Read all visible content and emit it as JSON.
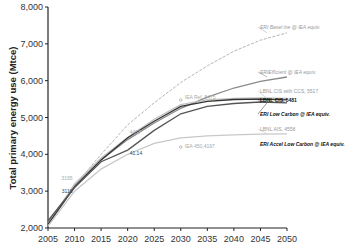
{
  "chart_data": {
    "type": "line",
    "title": "",
    "xlabel": "",
    "ylabel": "Total primary energy use (Mtce)",
    "xlim": [
      2005,
      2050
    ],
    "ylim": [
      2000,
      8000
    ],
    "x_ticks": [
      "2005",
      "2010",
      "2015",
      "2020",
      "2025",
      "2030",
      "2035",
      "2040",
      "2045",
      "2050"
    ],
    "y_ticks": [
      "2,000",
      "3,000",
      "4,000",
      "5,000",
      "6,000",
      "7,000",
      "8,000"
    ],
    "grid": false,
    "series": [
      {
        "name": "ERI Basel ine @ IEA equiv.",
        "style": "light-dashed",
        "color": "#b5b5b5",
        "label_italic": true,
        "label_bold": false,
        "x": [
          2005,
          2010,
          2015,
          2020,
          2025,
          2030,
          2035,
          2040,
          2045,
          2050
        ],
        "y": [
          2150,
          3150,
          4000,
          4800,
          5400,
          5950,
          6400,
          6800,
          7100,
          7300
        ]
      },
      {
        "name": "ERIEfficient @ IEA equiv.",
        "style": "solid",
        "color": "#8a8a8a",
        "label_italic": true,
        "label_bold": false,
        "x": [
          2005,
          2010,
          2015,
          2020,
          2025,
          2030,
          2035,
          2040,
          2045,
          2050
        ],
        "y": [
          2150,
          3150,
          3850,
          4400,
          4850,
          5250,
          5550,
          5800,
          5980,
          6100
        ]
      },
      {
        "name": "LBNL CIS with CCS, 5517",
        "style": "solid",
        "color": "#c0c0c0",
        "label_italic": false,
        "label_bold": false,
        "x": [
          2005,
          2010,
          2015,
          2020,
          2025,
          2030,
          2035,
          2040,
          2045,
          2050
        ],
        "y": [
          2100,
          3195,
          3900,
          4457,
          4950,
          5350,
          5480,
          5520,
          5530,
          5517
        ]
      },
      {
        "name": "LBNL CIS, 5481",
        "style": "solid",
        "color": "#333333",
        "label_italic": false,
        "label_bold": true,
        "x": [
          2005,
          2010,
          2015,
          2020,
          2025,
          2030,
          2035,
          2040,
          2045,
          2050
        ],
        "y": [
          2100,
          3116,
          3850,
          4450,
          4900,
          5300,
          5440,
          5490,
          5500,
          5481
        ]
      },
      {
        "name": "ERI Low Carbon @ IEA equiv.",
        "style": "solid",
        "color": "#555555",
        "label_italic": true,
        "label_bold": true,
        "x": [
          2005,
          2010,
          2015,
          2020,
          2025,
          2030,
          2035,
          2040,
          2045,
          2050
        ],
        "y": [
          2200,
          3100,
          3800,
          4114,
          4650,
          5100,
          5300,
          5380,
          5420,
          5400
        ]
      },
      {
        "name": "LBNL AIS, 4558",
        "style": "solid",
        "color": "#c8c8c8",
        "label_italic": false,
        "label_bold": false,
        "x": [
          2005,
          2010,
          2015,
          2020,
          2025,
          2030,
          2035,
          2040,
          2045,
          2050
        ],
        "y": [
          2050,
          3000,
          3600,
          4000,
          4300,
          4450,
          4500,
          4530,
          4550,
          4558
        ]
      }
    ],
    "extra_legend": [
      {
        "name": "ERI Accel Low Carbon @ IEA equiv.",
        "label_italic": true,
        "label_bold": true
      }
    ],
    "annotations": [
      {
        "text": "IEA Ref, 5475",
        "x": 2030,
        "y": 5475,
        "marker": "circle"
      },
      {
        "text": "IEA 450,4197",
        "x": 2030,
        "y": 4197,
        "marker": "circle"
      },
      {
        "text": "3195",
        "x": 2010,
        "y": 3195
      },
      {
        "text": "3116",
        "x": 2010,
        "y": 3116
      },
      {
        "text": "4457",
        "x": 2020,
        "y": 4457
      },
      {
        "text": "41.14",
        "x": 2020,
        "y": 4114
      }
    ]
  }
}
